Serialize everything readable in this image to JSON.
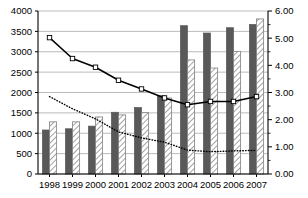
{
  "chart_data": {
    "type": "bar",
    "title": "",
    "subtitle": "",
    "xlabel": "",
    "ylabel": "",
    "y2label": "",
    "grid": true,
    "legend_position": "none",
    "categories": [
      "1998",
      "1999",
      "2000",
      "2001",
      "2002",
      "2003",
      "2004",
      "2005",
      "2006",
      "2007"
    ],
    "ylim": [
      0,
      4000
    ],
    "ytick_step": 500,
    "yticks": [
      "0",
      "500",
      "1000",
      "1500",
      "2000",
      "2500",
      "3000",
      "3500",
      "4000"
    ],
    "ylim_right": [
      0,
      6
    ],
    "ytick_step_right": 1,
    "yticks_right": [
      "0.00",
      "1.00",
      "2.00",
      "3.00",
      "4.00",
      "5.00",
      "6.00"
    ],
    "series": [
      {
        "name": "bar-solid-dark",
        "kind": "bar",
        "axis": "left",
        "style": "solid-fill",
        "color": "#595959",
        "values": [
          1080,
          1110,
          1175,
          1515,
          1630,
          1920,
          3640,
          3460,
          3590,
          3670
        ]
      },
      {
        "name": "bar-hatched",
        "kind": "bar",
        "axis": "left",
        "style": "diagonal-hatch",
        "color": "#f2f2f2",
        "values": [
          1280,
          1280,
          1400,
          1450,
          1505,
          1865,
          2800,
          2600,
          3010,
          3805
        ]
      },
      {
        "name": "line-solid",
        "kind": "line",
        "axis": "right",
        "style": "solid",
        "color": "#000000",
        "marker": "square",
        "values": [
          5.02,
          4.25,
          3.93,
          3.45,
          3.13,
          2.8,
          2.55,
          2.67,
          2.67,
          2.85
        ]
      },
      {
        "name": "line-dotted",
        "kind": "line",
        "axis": "right",
        "style": "dotted",
        "color": "#000000",
        "marker": "none",
        "values": [
          2.85,
          2.4,
          2.03,
          1.55,
          1.33,
          1.17,
          0.88,
          0.82,
          0.85,
          0.87
        ]
      }
    ]
  },
  "plot": {
    "left": 38,
    "right": 268,
    "top": 11,
    "bottom": 174,
    "axis_color": "#000000",
    "grid_color": "#b3b3b3",
    "bar_edge_color": "#595959"
  }
}
